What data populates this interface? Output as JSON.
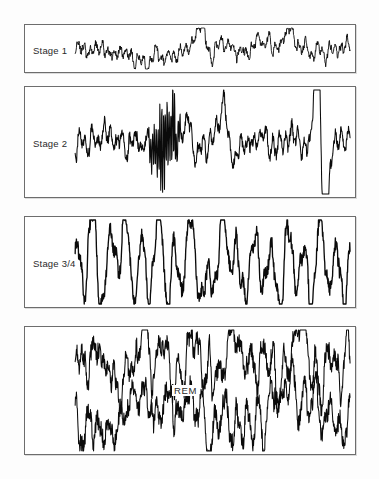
{
  "figure": {
    "background_color": "#fdfdfd",
    "panel_border_color": "#6d6d6d",
    "trace_color": "#0b0b0b",
    "label_color": "#2a2a2a"
  },
  "panels": [
    {
      "id": "stage-1",
      "label": "Stage 1",
      "x": 24,
      "y": 24,
      "width": 332,
      "height": 49,
      "label_x": 8,
      "label_y": 20,
      "trace_count": 1
    },
    {
      "id": "stage-2",
      "label": "Stage 2",
      "x": 24,
      "y": 86,
      "width": 332,
      "height": 112,
      "label_x": 8,
      "label_y": 51,
      "trace_count": 1
    },
    {
      "id": "stage-3-4",
      "label": "Stage 3/4",
      "x": 24,
      "y": 216,
      "width": 332,
      "height": 92,
      "label_x": 8,
      "label_y": 41,
      "trace_count": 1
    },
    {
      "id": "rem",
      "label": "REM",
      "x": 24,
      "y": 326,
      "width": 332,
      "height": 129,
      "label_x": 147,
      "label_y": 58,
      "trace_count": 2
    }
  ],
  "chart_data": {
    "type": "line",
    "xlabel": "",
    "ylabel": "",
    "grid": false,
    "legend": "none",
    "axis_ranges": {
      "x": [
        0,
        1
      ],
      "y": [
        -1,
        1
      ]
    },
    "annotations": [
      "Stage 1",
      "Stage 2",
      "Stage 3/4",
      "REM"
    ],
    "series": [
      {
        "name": "Stage 1",
        "description": "Low-amplitude mixed-frequency theta activity, 4-7 Hz",
        "panel": "stage-1",
        "baseline": 0.5,
        "amplitude": 0.18,
        "frequency": 46,
        "noise": 0.55,
        "seed": 11,
        "x_start": 0.152,
        "x_end": 0.985,
        "style": "thin",
        "spikes": [
          {
            "x": 0.46,
            "amp": 0.62
          },
          {
            "x": 0.5,
            "amp": -0.4
          },
          {
            "x": 0.78,
            "amp": 0.42
          }
        ]
      },
      {
        "name": "Stage 2",
        "description": "Mixed background with sleep spindle burst and large K-complex",
        "panel": "stage-2",
        "baseline": 0.5,
        "amplitude": 0.12,
        "frequency": 44,
        "noise": 0.6,
        "seed": 29,
        "x_start": 0.152,
        "x_end": 0.985,
        "style": "normal",
        "spindles": [
          {
            "x_start": 0.26,
            "x_end": 0.4,
            "amp": 0.34,
            "freq": 150
          }
        ],
        "spikes": [
          {
            "x": 0.545,
            "amp": 0.46
          },
          {
            "x": 0.555,
            "amp": -0.34
          },
          {
            "x": 0.885,
            "amp": 1.55
          },
          {
            "x": 0.905,
            "amp": -1.7
          }
        ]
      },
      {
        "name": "Stage 3/4",
        "description": "High-amplitude slow delta waves, 0.5-2 Hz",
        "panel": "stage-3-4",
        "baseline": 0.5,
        "amplitude": 0.62,
        "frequency": 17,
        "noise": 0.2,
        "seed": 7,
        "x_start": 0.152,
        "x_end": 0.985,
        "style": "thick",
        "spikes": []
      },
      {
        "name": "REM upper",
        "description": "Low-voltage mixed-frequency sawtooth-like activity, upper channel",
        "panel": "rem",
        "baseline": 0.3,
        "amplitude": 0.22,
        "frequency": 26,
        "noise": 0.5,
        "seed": 41,
        "x_start": 0.152,
        "x_end": 0.985,
        "style": "normal",
        "spikes": []
      },
      {
        "name": "REM lower",
        "description": "Low-voltage mixed-frequency sawtooth-like activity, lower channel",
        "panel": "rem",
        "baseline": 0.72,
        "amplitude": 0.22,
        "frequency": 24,
        "noise": 0.5,
        "seed": 83,
        "x_start": 0.152,
        "x_end": 0.985,
        "style": "normal",
        "spikes": []
      }
    ]
  }
}
